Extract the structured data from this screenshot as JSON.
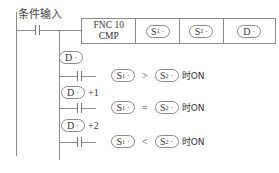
{
  "diagram": {
    "type": "ladder-diagram",
    "input_label": "条件输入",
    "instruction": {
      "fnc_line1": "FNC 10",
      "fnc_line2": "CMP",
      "operands": [
        {
          "name": "S",
          "sub": "1",
          "mark": "·"
        },
        {
          "name": "S",
          "sub": "2",
          "mark": "·"
        },
        {
          "name": "D",
          "sub": "",
          "mark": "·"
        }
      ]
    },
    "outputs": [
      {
        "device": "D",
        "mark": "·",
        "offset": "",
        "left": "S",
        "left_sub": "1",
        "operator": ">",
        "right": "S",
        "right_sub": "2",
        "suffix": "时ON"
      },
      {
        "device": "D",
        "mark": "·",
        "offset": "+1",
        "left": "S",
        "left_sub": "1",
        "operator": "=",
        "right": "S",
        "right_sub": "2",
        "suffix": "时ON"
      },
      {
        "device": "D",
        "mark": "·",
        "offset": "+2",
        "left": "S",
        "left_sub": "1",
        "operator": "<",
        "right": "S",
        "right_sub": "2",
        "suffix": "时ON"
      }
    ],
    "colors": {
      "line": "#8a8a8a",
      "text": "#333333",
      "background": "#ffffff"
    }
  }
}
